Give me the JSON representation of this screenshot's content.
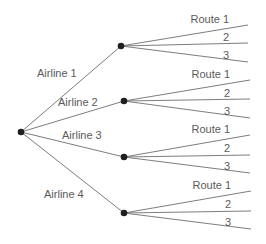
{
  "diagram": {
    "type": "tree",
    "root": {
      "x": 21,
      "y": 132
    },
    "node_color": "#1f1f1f",
    "edge_color": "#6e6e6e",
    "text_color": "#5a5a5a",
    "branches": [
      {
        "label": "Airline 1",
        "label_pos": {
          "x": 37,
          "y": 77
        },
        "node": {
          "x": 121,
          "y": 46
        },
        "routes": [
          {
            "label": "Route 1",
            "end": {
              "x": 248,
              "y": 25
            },
            "label_pos": {
              "x": 229,
              "y": 23
            }
          },
          {
            "label": "2",
            "end": {
              "x": 248,
              "y": 43
            },
            "label_pos": {
              "x": 229,
              "y": 41
            }
          },
          {
            "label": "3",
            "end": {
              "x": 248,
              "y": 62
            },
            "label_pos": {
              "x": 229,
              "y": 59
            }
          }
        ]
      },
      {
        "label": "Airline 2",
        "label_pos": {
          "x": 58,
          "y": 106
        },
        "node": {
          "x": 124,
          "y": 101
        },
        "routes": [
          {
            "label": "Route 1",
            "end": {
              "x": 250,
              "y": 80
            },
            "label_pos": {
              "x": 230,
              "y": 78
            }
          },
          {
            "label": "2",
            "end": {
              "x": 250,
              "y": 99
            },
            "label_pos": {
              "x": 230,
              "y": 97
            }
          },
          {
            "label": "3",
            "end": {
              "x": 250,
              "y": 118
            },
            "label_pos": {
              "x": 230,
              "y": 115
            }
          }
        ]
      },
      {
        "label": "Airline 3",
        "label_pos": {
          "x": 62,
          "y": 139
        },
        "node": {
          "x": 124,
          "y": 157
        },
        "routes": [
          {
            "label": "Route 1",
            "end": {
              "x": 250,
              "y": 135
            },
            "label_pos": {
              "x": 230,
              "y": 133
            }
          },
          {
            "label": "2",
            "end": {
              "x": 250,
              "y": 155
            },
            "label_pos": {
              "x": 230,
              "y": 152
            }
          },
          {
            "label": "3",
            "end": {
              "x": 250,
              "y": 173
            },
            "label_pos": {
              "x": 230,
              "y": 170
            }
          }
        ]
      },
      {
        "label": "Airline 4",
        "label_pos": {
          "x": 44,
          "y": 198
        },
        "node": {
          "x": 124,
          "y": 213
        },
        "routes": [
          {
            "label": "Route 1",
            "end": {
              "x": 251,
              "y": 191
            },
            "label_pos": {
              "x": 231,
              "y": 189
            }
          },
          {
            "label": "2",
            "end": {
              "x": 251,
              "y": 211
            },
            "label_pos": {
              "x": 231,
              "y": 208
            }
          },
          {
            "label": "3",
            "end": {
              "x": 251,
              "y": 229
            },
            "label_pos": {
              "x": 231,
              "y": 226
            }
          }
        ]
      }
    ]
  }
}
